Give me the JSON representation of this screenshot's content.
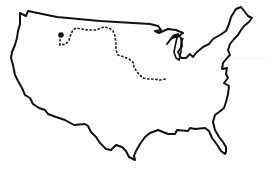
{
  "map": {
    "title": "",
    "region": "contiguous-united-states",
    "outline_color": "#111111",
    "state_border_color": "#e6e6e6",
    "route_color": "#1a1a1a",
    "background_color": "#ffffff",
    "route": {
      "style": "dashed",
      "start_marker": "filled-dot",
      "label": ""
    }
  }
}
